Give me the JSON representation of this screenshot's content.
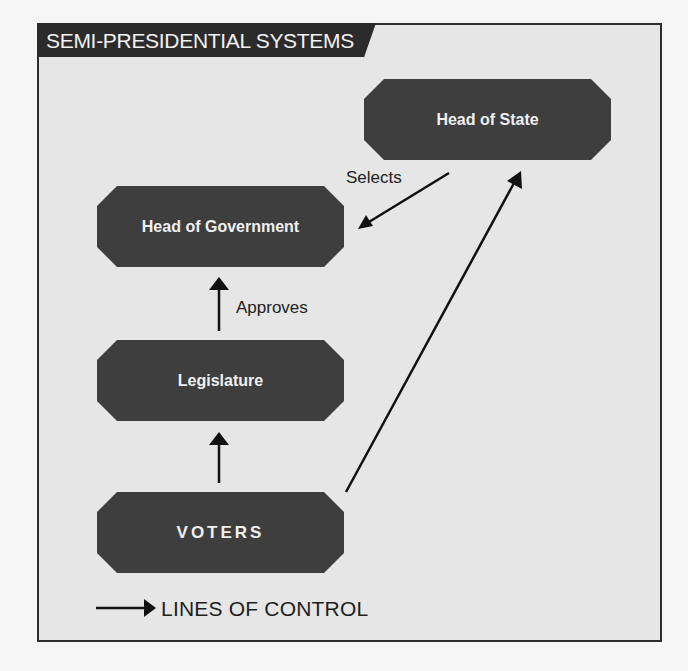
{
  "title": "SEMI-PRESIDENTIAL SYSTEMS",
  "colors": {
    "background": "#f6f6f6",
    "panel": "#e6e6e6",
    "node_fill": "#3e3e3e",
    "node_text": "#f0f0f0",
    "title_bar": "#2b2b2b",
    "arrow": "#111111"
  },
  "nodes": {
    "head_of_state": "Head of State",
    "head_of_government": "Head of Government",
    "legislature": "Legislature",
    "voters": "VOTERS"
  },
  "edges": [
    {
      "from": "Head of State",
      "to": "Head of Government",
      "label": "Selects"
    },
    {
      "from": "Legislature",
      "to": "Head of Government",
      "label": "Approves"
    },
    {
      "from": "Voters",
      "to": "Legislature",
      "label": ""
    },
    {
      "from": "Voters",
      "to": "Head of State",
      "label": ""
    }
  ],
  "edge_labels": {
    "selects": "Selects",
    "approves": "Approves"
  },
  "legend": {
    "label": "LINES OF CONTROL",
    "icon": "right-arrow-icon"
  }
}
